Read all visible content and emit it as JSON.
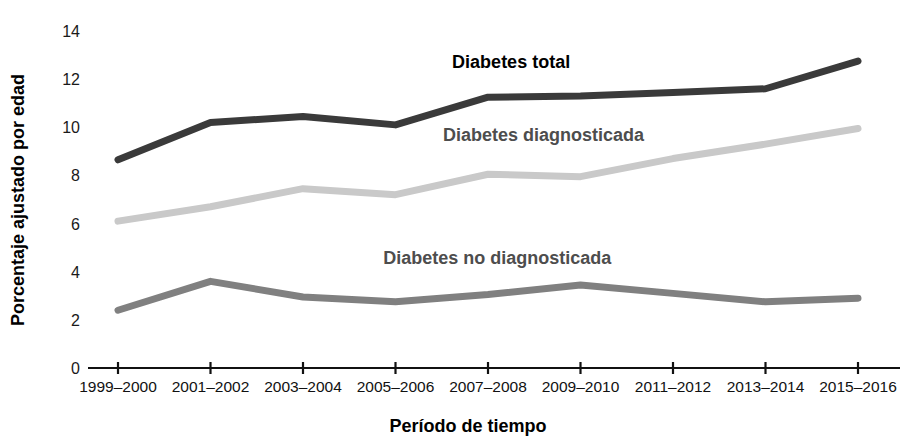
{
  "chart_data": {
    "type": "line",
    "title": "",
    "xlabel": "Período de tiempo",
    "ylabel": "Porcentaje ajustado por edad",
    "categories": [
      "1999–2000",
      "2001–2002",
      "2003–2004",
      "2005–2006",
      "2007–2008",
      "2009–2010",
      "2011–2012",
      "2013–2014",
      "2015–2016"
    ],
    "ylim": [
      0,
      14
    ],
    "yticks": [
      0,
      2,
      4,
      6,
      8,
      10,
      12,
      14
    ],
    "ytick_labels": [
      "0",
      "2",
      "4",
      "6",
      "8",
      "10",
      "12",
      "14"
    ],
    "grid": false,
    "legend_position": "inline-annotations",
    "series": [
      {
        "name": "Diabetes total",
        "color": "#3a3a3a",
        "values": [
          8.65,
          10.2,
          10.45,
          10.1,
          11.25,
          11.3,
          11.45,
          11.6,
          12.75
        ],
        "label_x_value": 4.25,
        "label_y_value": 12.45,
        "label_anchor": "middle"
      },
      {
        "name": "Diabetes diagnosticada",
        "color": "#c9c9c9",
        "values": [
          6.1,
          6.7,
          7.45,
          7.2,
          8.05,
          7.95,
          8.7,
          9.3,
          9.95
        ],
        "label_x_value": 4.6,
        "label_y_value": 9.45,
        "label_anchor": "middle"
      },
      {
        "name": "Diabetes no diagnosticada",
        "color": "#808080",
        "values": [
          2.4,
          3.6,
          2.95,
          2.75,
          3.05,
          3.45,
          3.1,
          2.75,
          2.9
        ],
        "label_x_value": 4.1,
        "label_y_value": 4.3,
        "label_anchor": "middle"
      }
    ]
  },
  "colors": {
    "background": "#ffffff",
    "axis": "#111111",
    "total": "#3a3a3a",
    "diagnosed": "#c9c9c9",
    "undiagnosed": "#808080"
  },
  "axes": {
    "y_axis_title": "Porcentaje ajustado por edad",
    "x_axis_title": "Período de tiempo"
  }
}
